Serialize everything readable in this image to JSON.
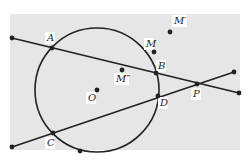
{
  "diagram": {
    "background": {
      "color": "#e6e6e6",
      "x": 10,
      "y": 14,
      "width": 230,
      "height": 136
    },
    "stroke_color": "#222222",
    "circle": {
      "cx": 97,
      "cy": 90,
      "r": 62
    },
    "lines": [
      {
        "name": "line-A-B-P",
        "x1": 12,
        "y1": 38,
        "x2": 239,
        "y2": 93
      },
      {
        "name": "line-C-D-P",
        "x1": 12,
        "y1": 147,
        "x2": 234,
        "y2": 72
      }
    ],
    "points": [
      {
        "id": "endpoint-left-top",
        "x": 12,
        "y": 38,
        "label": ""
      },
      {
        "id": "A",
        "x": 52,
        "y": 48,
        "label": "A",
        "lx": 47,
        "ly": 41
      },
      {
        "id": "M",
        "x": 154,
        "y": 52,
        "label": "M",
        "lx": 146,
        "ly": 47
      },
      {
        "id": "M-prime",
        "x": 170,
        "y": 32,
        "label": "M′",
        "lx": 174,
        "ly": 24
      },
      {
        "id": "B",
        "x": 156,
        "y": 73,
        "label": "B",
        "lx": 158,
        "ly": 69
      },
      {
        "id": "M-double-prime",
        "x": 122,
        "y": 70,
        "label": "M″",
        "lx": 116,
        "ly": 82
      },
      {
        "id": "O",
        "x": 97,
        "y": 90,
        "label": "O",
        "lx": 88,
        "ly": 101
      },
      {
        "id": "D",
        "x": 158,
        "y": 96,
        "label": "D",
        "lx": 160,
        "ly": 106
      },
      {
        "id": "P",
        "x": 197,
        "y": 84,
        "label": "P",
        "lx": 193,
        "ly": 97
      },
      {
        "id": "endpoint-right-top",
        "x": 234,
        "y": 72,
        "label": ""
      },
      {
        "id": "endpoint-right-bottom",
        "x": 239,
        "y": 93,
        "label": ""
      },
      {
        "id": "C",
        "x": 53,
        "y": 133,
        "label": "C",
        "lx": 47,
        "ly": 146
      },
      {
        "id": "endpoint-left-bottom",
        "x": 12,
        "y": 147,
        "label": ""
      },
      {
        "id": "circle-bottom-point",
        "x": 80,
        "y": 151,
        "label": ""
      }
    ]
  }
}
